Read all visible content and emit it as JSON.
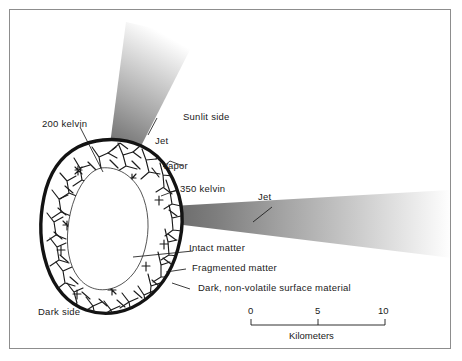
{
  "figure": {
    "background_color": "#ffffff",
    "frame_color": "#8d8d8d",
    "ink_color": "#1a1a1a"
  },
  "labels": {
    "temp_200": "200 kelvin",
    "temp_350": "350 kelvin",
    "jet_top": "Jet",
    "jet_right": "Jet",
    "sunlit_side": "Sunlit side",
    "dark_side": "Dark side",
    "vapor": "Vapor",
    "intact_matter": "Intact matter",
    "fragmented_matter": "Fragmented matter",
    "dark_surface": "Dark, non-volatile surface material"
  },
  "scale_bar": {
    "caption": "Kilometers",
    "ticks": [
      "0",
      "5",
      "10"
    ],
    "min": 0,
    "max": 10,
    "unit": "Kilometers"
  },
  "nucleus": {
    "outline_color": "#141414",
    "interior_color": "#ffffff",
    "crack_color": "#1c1c1c",
    "regions": [
      "intact matter core",
      "fragmented matter shell",
      "dark non-volatile surface crust"
    ]
  },
  "jets": [
    {
      "name": "top-jet",
      "direction": "up-right",
      "origin_label": "sunlit side",
      "base_color": "#6e6e6e",
      "tip_color": "#ffffff"
    },
    {
      "name": "right-jet",
      "direction": "right",
      "origin_label": "sunlit side",
      "base_color": "#6e6e6e",
      "tip_color": "#ffffff"
    }
  ]
}
